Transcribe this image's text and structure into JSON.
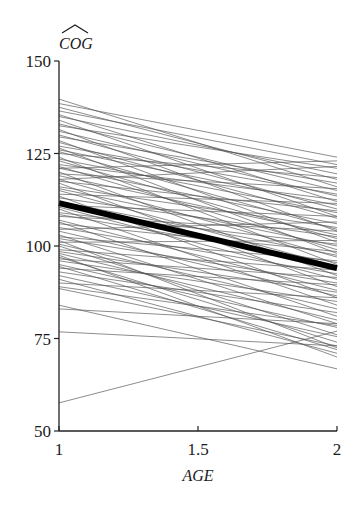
{
  "chart_data": {
    "type": "line",
    "title": "",
    "xlabel": "AGE",
    "ylabel": "COG (hat)",
    "ylabel_text": "COG",
    "ylabel_has_hat": true,
    "xlim": [
      1,
      2
    ],
    "ylim": [
      50,
      150
    ],
    "x_ticks": [
      1,
      1.5,
      2
    ],
    "x_tick_labels": [
      "1",
      "1.5",
      "2"
    ],
    "y_ticks": [
      50,
      75,
      100,
      125,
      150
    ],
    "y_tick_labels": [
      "50",
      "75",
      "100",
      "125",
      "150"
    ],
    "grid": false,
    "legend": null,
    "x": [
      1,
      2
    ],
    "mean_line": {
      "name": "average",
      "values": [
        111.6,
        94.0
      ],
      "stroke_width": 6,
      "color": "#000000"
    },
    "individual_line_color": "#555555",
    "series": [
      {
        "values": [
          139.7,
          116.0
        ]
      },
      {
        "values": [
          138.5,
          124.0
        ]
      },
      {
        "values": [
          137.5,
          118.0
        ]
      },
      {
        "values": [
          136.5,
          122.0
        ]
      },
      {
        "values": [
          135.5,
          112.0
        ]
      },
      {
        "values": [
          135.0,
          119.5
        ]
      },
      {
        "values": [
          134.0,
          108.0
        ]
      },
      {
        "values": [
          133.0,
          115.0
        ]
      },
      {
        "values": [
          132.5,
          121.0
        ]
      },
      {
        "values": [
          131.5,
          104.0
        ]
      },
      {
        "values": [
          131.0,
          113.5
        ]
      },
      {
        "values": [
          130.0,
          110.0
        ]
      },
      {
        "values": [
          129.5,
          117.0
        ]
      },
      {
        "values": [
          128.5,
          101.0
        ]
      },
      {
        "values": [
          128.0,
          107.5
        ]
      },
      {
        "values": [
          127.0,
          114.0
        ]
      },
      {
        "values": [
          126.5,
          98.0
        ]
      },
      {
        "values": [
          126.0,
          111.0
        ]
      },
      {
        "values": [
          125.5,
          104.5
        ]
      },
      {
        "values": [
          125.0,
          118.5
        ]
      },
      {
        "values": [
          124.0,
          95.0
        ]
      },
      {
        "values": [
          123.5,
          109.0
        ]
      },
      {
        "values": [
          123.0,
          102.0
        ]
      },
      {
        "values": [
          122.0,
          112.5
        ]
      },
      {
        "values": [
          121.5,
          99.0
        ]
      },
      {
        "values": [
          121.0,
          106.0
        ]
      },
      {
        "values": [
          120.0,
          92.0
        ]
      },
      {
        "values": [
          119.5,
          115.5
        ]
      },
      {
        "values": [
          119.0,
          103.0
        ]
      },
      {
        "values": [
          118.0,
          97.0
        ]
      },
      {
        "values": [
          117.5,
          109.5
        ]
      },
      {
        "values": [
          117.0,
          89.0
        ]
      },
      {
        "values": [
          116.0,
          105.0
        ]
      },
      {
        "values": [
          115.5,
          100.0
        ]
      },
      {
        "values": [
          115.0,
          94.5
        ]
      },
      {
        "values": [
          114.0,
          111.5
        ]
      },
      {
        "values": [
          113.5,
          86.0
        ]
      },
      {
        "values": [
          113.0,
          102.5
        ]
      },
      {
        "values": [
          112.0,
          97.5
        ]
      },
      {
        "values": [
          111.0,
          108.0
        ]
      },
      {
        "values": [
          110.5,
          91.0
        ]
      },
      {
        "values": [
          110.0,
          84.0
        ]
      },
      {
        "values": [
          109.0,
          100.5
        ]
      },
      {
        "values": [
          108.5,
          95.5
        ]
      },
      {
        "values": [
          108.0,
          104.0
        ]
      },
      {
        "values": [
          107.0,
          88.0
        ]
      },
      {
        "values": [
          106.5,
          81.0
        ]
      },
      {
        "values": [
          106.0,
          98.5
        ]
      },
      {
        "values": [
          105.0,
          92.5
        ]
      },
      {
        "values": [
          104.5,
          106.5
        ]
      },
      {
        "values": [
          104.0,
          86.5
        ]
      },
      {
        "values": [
          103.0,
          79.0
        ]
      },
      {
        "values": [
          102.5,
          96.0
        ]
      },
      {
        "values": [
          102.0,
          90.0
        ]
      },
      {
        "values": [
          101.0,
          101.5
        ]
      },
      {
        "values": [
          100.5,
          83.0
        ]
      },
      {
        "values": [
          100.0,
          76.0
        ]
      },
      {
        "values": [
          99.0,
          93.5
        ]
      },
      {
        "values": [
          98.5,
          87.5
        ]
      },
      {
        "values": [
          98.0,
          80.0
        ]
      },
      {
        "values": [
          97.0,
          74.0
        ]
      },
      {
        "values": [
          96.5,
          91.5
        ]
      },
      {
        "values": [
          96.0,
          85.0
        ]
      },
      {
        "values": [
          95.0,
          78.0
        ]
      },
      {
        "values": [
          94.5,
          72.0
        ]
      },
      {
        "values": [
          94.0,
          89.5
        ]
      },
      {
        "values": [
          93.0,
          82.0
        ]
      },
      {
        "values": [
          92.0,
          75.5
        ]
      },
      {
        "values": [
          91.0,
          71.0
        ]
      },
      {
        "values": [
          90.0,
          86.0
        ]
      },
      {
        "values": [
          89.0,
          78.5
        ]
      },
      {
        "values": [
          88.5,
          73.0
        ]
      },
      {
        "values": [
          84.0,
          66.8
        ]
      },
      {
        "values": [
          83.0,
          79.0
        ]
      },
      {
        "values": [
          76.8,
          73.0
        ]
      },
      {
        "values": [
          57.6,
          77.0
        ]
      },
      {
        "values": [
          121.0,
          123.0
        ]
      },
      {
        "values": [
          118.0,
          121.5
        ]
      },
      {
        "values": [
          97.5,
          70.0
        ]
      },
      {
        "values": [
          101.5,
          72.5
        ]
      }
    ]
  }
}
